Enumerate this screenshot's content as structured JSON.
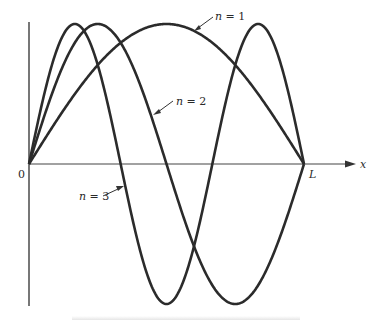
{
  "figure": {
    "type": "diagram",
    "axis": {
      "x_label": "x",
      "origin_label": "0",
      "end_label": "L"
    },
    "curves": [
      {
        "n": 1,
        "label": "n = 1",
        "label_n": "n",
        "label_eq": " = 1"
      },
      {
        "n": 2,
        "label": "n = 2",
        "label_n": "n",
        "label_eq": " = 2"
      },
      {
        "n": 3,
        "label": "n = 3",
        "label_n": "n",
        "label_eq": " = 3"
      }
    ],
    "colors": {
      "curve": "#2b2b2b",
      "axis": "#3a3a3a",
      "background": "#ffffff"
    }
  }
}
